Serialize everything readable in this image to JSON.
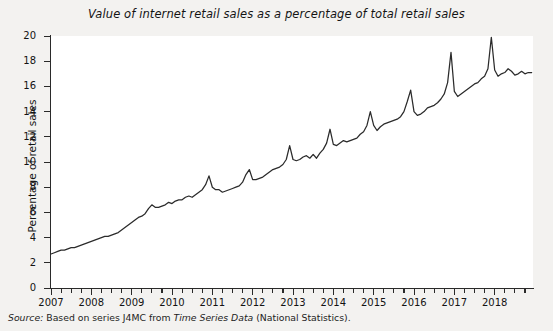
{
  "chart_data": {
    "type": "line",
    "title": "Value of internet retail sales as a percentage of total retail sales",
    "xlabel": "",
    "ylabel": "Percentage of retail sales",
    "ylim": [
      0,
      20
    ],
    "xlim": [
      2007.0,
      2018.95
    ],
    "ytick_labels": [
      "0",
      "2",
      "4",
      "6",
      "8",
      "10",
      "12",
      "14",
      "16",
      "18",
      "20"
    ],
    "ytick_values": [
      0,
      2,
      4,
      6,
      8,
      10,
      12,
      14,
      16,
      18,
      20
    ],
    "xtick_labels": [
      "2007",
      "2008",
      "2009",
      "2010",
      "2011",
      "2012",
      "2013",
      "2014",
      "2015",
      "2016",
      "2017",
      "2018"
    ],
    "xtick_values": [
      2007,
      2008,
      2009,
      2010,
      2011,
      2012,
      2013,
      2014,
      2015,
      2016,
      2017,
      2018
    ],
    "minor_ticks_per_year": 4,
    "grid": false,
    "legend": "none",
    "line_color": "#2b2b2b",
    "plot_background": "#ffffff",
    "figure_background": "#f3f2f0",
    "series": [
      {
        "name": "Internet retail sales as % of total retail sales",
        "x": [
          2007.0,
          2007.083,
          2007.167,
          2007.25,
          2007.333,
          2007.417,
          2007.5,
          2007.583,
          2007.667,
          2007.75,
          2007.833,
          2007.917,
          2008.0,
          2008.083,
          2008.167,
          2008.25,
          2008.333,
          2008.417,
          2008.5,
          2008.583,
          2008.667,
          2008.75,
          2008.833,
          2008.917,
          2009.0,
          2009.083,
          2009.167,
          2009.25,
          2009.333,
          2009.417,
          2009.5,
          2009.583,
          2009.667,
          2009.75,
          2009.833,
          2009.917,
          2010.0,
          2010.083,
          2010.167,
          2010.25,
          2010.333,
          2010.417,
          2010.5,
          2010.583,
          2010.667,
          2010.75,
          2010.833,
          2010.917,
          2011.0,
          2011.083,
          2011.167,
          2011.25,
          2011.333,
          2011.417,
          2011.5,
          2011.583,
          2011.667,
          2011.75,
          2011.833,
          2011.917,
          2012.0,
          2012.083,
          2012.167,
          2012.25,
          2012.333,
          2012.417,
          2012.5,
          2012.583,
          2012.667,
          2012.75,
          2012.833,
          2012.917,
          2013.0,
          2013.083,
          2013.167,
          2013.25,
          2013.333,
          2013.417,
          2013.5,
          2013.583,
          2013.667,
          2013.75,
          2013.833,
          2013.917,
          2014.0,
          2014.083,
          2014.167,
          2014.25,
          2014.333,
          2014.417,
          2014.5,
          2014.583,
          2014.667,
          2014.75,
          2014.833,
          2014.917,
          2015.0,
          2015.083,
          2015.167,
          2015.25,
          2015.333,
          2015.417,
          2015.5,
          2015.583,
          2015.667,
          2015.75,
          2015.833,
          2015.917,
          2016.0,
          2016.083,
          2016.167,
          2016.25,
          2016.333,
          2016.417,
          2016.5,
          2016.583,
          2016.667,
          2016.75,
          2016.833,
          2016.917,
          2017.0,
          2017.083,
          2017.167,
          2017.25,
          2017.333,
          2017.417,
          2017.5,
          2017.583,
          2017.667,
          2017.75,
          2017.833,
          2017.917,
          2018.0,
          2018.083,
          2018.167,
          2018.25,
          2018.333,
          2018.417,
          2018.5,
          2018.583,
          2018.667,
          2018.75,
          2018.833,
          2018.917
        ],
        "y": [
          2.7,
          2.8,
          2.9,
          3.0,
          3.0,
          3.1,
          3.2,
          3.2,
          3.3,
          3.4,
          3.5,
          3.6,
          3.7,
          3.8,
          3.9,
          4.0,
          4.1,
          4.1,
          4.2,
          4.3,
          4.4,
          4.6,
          4.8,
          5.0,
          5.2,
          5.4,
          5.6,
          5.7,
          5.9,
          6.3,
          6.6,
          6.4,
          6.4,
          6.5,
          6.6,
          6.8,
          6.7,
          6.9,
          7.0,
          7.0,
          7.2,
          7.3,
          7.2,
          7.4,
          7.6,
          7.8,
          8.2,
          8.9,
          8.0,
          7.8,
          7.8,
          7.6,
          7.7,
          7.8,
          7.9,
          8.0,
          8.1,
          8.4,
          9.0,
          9.4,
          8.6,
          8.6,
          8.7,
          8.8,
          9.0,
          9.2,
          9.4,
          9.5,
          9.6,
          9.8,
          10.2,
          11.3,
          10.2,
          10.1,
          10.2,
          10.4,
          10.5,
          10.3,
          10.6,
          10.3,
          10.7,
          11.0,
          11.5,
          12.6,
          11.4,
          11.3,
          11.5,
          11.7,
          11.6,
          11.7,
          11.8,
          11.9,
          12.2,
          12.4,
          12.9,
          14.0,
          12.9,
          12.5,
          12.8,
          13.0,
          13.1,
          13.2,
          13.3,
          13.4,
          13.6,
          14.0,
          14.8,
          15.7,
          14.0,
          13.7,
          13.8,
          14.0,
          14.3,
          14.4,
          14.5,
          14.7,
          15.0,
          15.4,
          16.3,
          18.7,
          15.6,
          15.2,
          15.4,
          15.6,
          15.8,
          16.0,
          16.2,
          16.3,
          16.6,
          16.8,
          17.4,
          19.9,
          17.3,
          16.8,
          17.0,
          17.1,
          17.4,
          17.2,
          16.9,
          17.0,
          17.2,
          17.0,
          17.1,
          17.1
        ]
      }
    ],
    "annotations": []
  },
  "source": {
    "prefix": "Source:",
    "body_before": "Based on series J4MC from",
    "italic_title": "Time Series Data",
    "body_after": "(National Statistics)."
  }
}
